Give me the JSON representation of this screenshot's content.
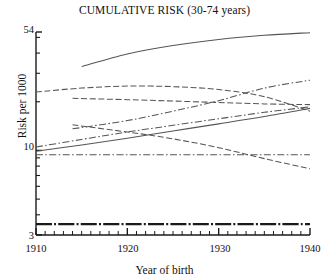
{
  "chart_data": {
    "type": "line",
    "title": "CUMULATIVE RISK (30-74 years)",
    "xlabel": "Year of birth",
    "ylabel": "Risk per 1000",
    "yscale": "log",
    "ylim": [
      3,
      54
    ],
    "xlim": [
      1910,
      1940
    ],
    "grid": false,
    "legend": "none",
    "ytick_labels": [
      "54",
      "10",
      "3"
    ],
    "ytick_values": [
      54,
      10,
      3
    ],
    "xtick_labels": [
      "1910",
      "1920",
      "1930",
      "1940"
    ],
    "xtick_values": [
      1910,
      1920,
      1930,
      1940
    ],
    "x_minor_tick_step": 1,
    "series": [
      {
        "name": "series-1-top-solid",
        "style": "solid",
        "x": [
          1915,
          1920,
          1925,
          1930,
          1935,
          1940
        ],
        "values": [
          33.0,
          39.5,
          44.5,
          48.5,
          51.5,
          53.5
        ]
      },
      {
        "name": "series-2-long-dash-upper",
        "style": "dashed",
        "x": [
          1910,
          1915,
          1920,
          1925,
          1930,
          1935,
          1940
        ],
        "values": [
          23.0,
          24.3,
          25.0,
          24.8,
          23.8,
          21.5,
          17.5
        ]
      },
      {
        "name": "series-3-dashed-flat",
        "style": "dashed",
        "x": [
          1914,
          1920,
          1925,
          1930,
          1935,
          1940
        ],
        "values": [
          21.0,
          20.6,
          20.2,
          19.8,
          19.4,
          19.2
        ]
      },
      {
        "name": "series-4-dash-dot-rising-steep",
        "style": "dash-dot",
        "x": [
          1914,
          1920,
          1925,
          1930,
          1935,
          1940
        ],
        "values": [
          13.6,
          15.3,
          17.5,
          20.3,
          24.3,
          27.2
        ]
      },
      {
        "name": "series-5-dash-dot-rising-shallow",
        "style": "dash-dot",
        "x": [
          1910,
          1915,
          1920,
          1925,
          1930,
          1935,
          1940
        ],
        "values": [
          10.5,
          11.7,
          13.0,
          14.3,
          15.7,
          17.2,
          18.6
        ]
      },
      {
        "name": "series-6-solid-rising",
        "style": "solid",
        "x": [
          1910,
          1915,
          1920,
          1925,
          1930,
          1935,
          1940
        ],
        "values": [
          9.9,
          10.8,
          11.9,
          13.2,
          14.6,
          16.2,
          18.2
        ]
      },
      {
        "name": "series-7-dashed-falling",
        "style": "dashed",
        "x": [
          1914,
          1920,
          1925,
          1930,
          1935,
          1940
        ],
        "values": [
          14.4,
          13.0,
          11.8,
          10.4,
          8.9,
          7.7
        ]
      },
      {
        "name": "series-8-dash-dot-flat",
        "style": "dash-dot",
        "x": [
          1910,
          1920,
          1930,
          1940
        ],
        "values": [
          9.4,
          9.4,
          9.4,
          9.4
        ]
      },
      {
        "name": "series-9-thick-dash-dot-bottom",
        "style": "thick-dash-dot",
        "x": [
          1910,
          1920,
          1930,
          1940
        ],
        "values": [
          3.5,
          3.5,
          3.5,
          3.5
        ]
      }
    ]
  },
  "axes": {
    "y_top_label": "54",
    "y_mid_label": "10",
    "y_bottom_label": "3",
    "x_labels": [
      "1910",
      "1920",
      "1930",
      "1940"
    ]
  },
  "colors": {
    "ink": "#1a1a1a",
    "line": "#555555",
    "background": "#ffffff"
  }
}
